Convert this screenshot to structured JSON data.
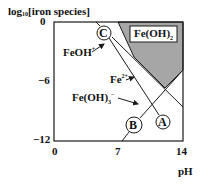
{
  "diagram": {
    "type": "speciation-diagram",
    "y_axis": {
      "label_prefix": "log",
      "label_sub": "10",
      "label_suffix": "[iron species]",
      "ticks": [
        "0",
        "−6",
        "−12"
      ]
    },
    "x_axis": {
      "label": "pH",
      "ticks": [
        "0",
        "7",
        "14"
      ]
    },
    "region_label": {
      "base": "Fe(OH)",
      "sub": "2"
    },
    "species_labels": [
      {
        "base": "FeOH",
        "sup": "+"
      },
      {
        "base": "Fe",
        "sup": "2+"
      },
      {
        "base": "Fe(OH)",
        "sub": "3",
        "sup": "−"
      }
    ],
    "line_markers": [
      "A",
      "B",
      "C"
    ],
    "colors": {
      "shaded_region": "#a6a6a6",
      "line": "#1a1a1a",
      "frame": "#1a1a1a"
    }
  }
}
